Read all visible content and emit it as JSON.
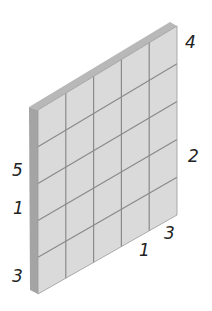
{
  "diagram": {
    "type": "isometric-grid-panel",
    "rows": 5,
    "cols": 5,
    "colors": {
      "face": "#dcdcdc",
      "side": "#a8a8a8",
      "top": "#bdbdbd",
      "grid": "#8a8a8a"
    },
    "labels": [
      {
        "id": "label-4",
        "text": "4",
        "x": 185,
        "y": 34
      },
      {
        "id": "label-2",
        "text": "2",
        "x": 188,
        "y": 148
      },
      {
        "id": "label-5",
        "text": "5",
        "x": 12,
        "y": 162
      },
      {
        "id": "label-1-left",
        "text": "1",
        "x": 13,
        "y": 200
      },
      {
        "id": "label-3-left",
        "text": "3",
        "x": 12,
        "y": 268
      },
      {
        "id": "label-1-bottom",
        "text": "1",
        "x": 139,
        "y": 242
      },
      {
        "id": "label-3-bottom",
        "text": "3",
        "x": 164,
        "y": 225
      }
    ]
  }
}
